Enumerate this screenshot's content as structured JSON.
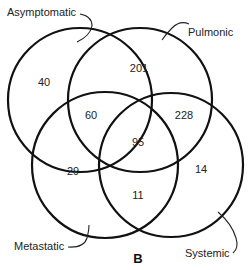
{
  "figure": {
    "panel_label": "B",
    "sets": [
      {
        "name": "Asymptomatic"
      },
      {
        "name": "Pulmonic"
      },
      {
        "name": "Metastatic"
      },
      {
        "name": "Systemic"
      }
    ],
    "regions": {
      "asymptomatic_only": "40",
      "pulmonic_only": "201",
      "asymptomatic_pulmonic_metastatic": "60",
      "pulmonic_systemic": "228",
      "all_center": "95",
      "metastatic_only": "29",
      "systemic_only": "14",
      "metastatic_systemic": "11"
    }
  }
}
